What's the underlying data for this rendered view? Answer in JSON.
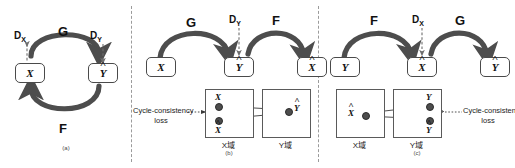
{
  "figure": {
    "colors": {
      "arrow": "#4d4d4d",
      "dashed_arrow": "#6e6e6e",
      "box_border": "#4a4a4a",
      "divider": "#9b9b9b",
      "point": "#4d4d4d",
      "background": "#ffffff"
    }
  },
  "panel_a": {
    "caption": "(a)",
    "nodes": [
      {
        "id": "x",
        "label": "X",
        "hat": false
      },
      {
        "id": "y_hat",
        "label": "Y",
        "hat": true
      }
    ],
    "mappings": [
      {
        "id": "g",
        "label": "G",
        "from": "x",
        "to": "y_hat"
      },
      {
        "id": "f",
        "label": "F",
        "from": "y_hat",
        "to": "x"
      }
    ],
    "discriminators": [
      {
        "id": "dx",
        "label": "D",
        "subscript": "X",
        "target": "x"
      },
      {
        "id": "dy",
        "label": "D",
        "subscript": "Y",
        "target": "y_hat"
      }
    ]
  },
  "panel_b": {
    "caption": "(b)",
    "nodes": [
      {
        "id": "x",
        "label": "X",
        "hat": false
      },
      {
        "id": "y_hat",
        "label": "Y",
        "hat": true
      },
      {
        "id": "x_hat",
        "label": "X",
        "hat": true
      }
    ],
    "mappings": [
      {
        "id": "g",
        "label": "G",
        "from": "x",
        "to": "y_hat"
      },
      {
        "id": "f",
        "label": "F",
        "from": "y_hat",
        "to": "x_hat"
      }
    ],
    "discriminators": [
      {
        "id": "dy",
        "label": "D",
        "subscript": "Y",
        "target": "y_hat"
      }
    ],
    "loss_label_line1": "Cycle-consistency",
    "loss_label_line2": "loss",
    "domains": [
      {
        "id": "x_domain",
        "label": "X域"
      },
      {
        "id": "y_domain",
        "label": "Y域"
      }
    ],
    "points": [
      {
        "id": "p_x",
        "label": "X",
        "hat": false,
        "domain": "x_domain"
      },
      {
        "id": "p_x_hat",
        "label": "X",
        "hat": true,
        "domain": "x_domain"
      },
      {
        "id": "p_y_hat",
        "label": "Y",
        "hat": true,
        "domain": "y_domain"
      }
    ]
  },
  "panel_c": {
    "caption": "(c)",
    "nodes": [
      {
        "id": "y",
        "label": "Y",
        "hat": false
      },
      {
        "id": "x_hat",
        "label": "X",
        "hat": true
      },
      {
        "id": "y_hat",
        "label": "Y",
        "hat": true
      }
    ],
    "mappings": [
      {
        "id": "f",
        "label": "F",
        "from": "y",
        "to": "x_hat"
      },
      {
        "id": "g",
        "label": "G",
        "from": "x_hat",
        "to": "y_hat"
      }
    ],
    "discriminators": [
      {
        "id": "dx",
        "label": "D",
        "subscript": "X",
        "target": "x_hat"
      }
    ],
    "loss_label_line1": "Cycle-consistency",
    "loss_label_line2": "loss",
    "domains": [
      {
        "id": "x_domain",
        "label": "X域"
      },
      {
        "id": "y_domain",
        "label": "Y域"
      }
    ],
    "points": [
      {
        "id": "p_x_hat",
        "label": "X",
        "hat": true,
        "domain": "x_domain"
      },
      {
        "id": "p_y",
        "label": "Y",
        "hat": false,
        "domain": "y_domain"
      },
      {
        "id": "p_y_hat",
        "label": "Y",
        "hat": true,
        "domain": "y_domain"
      }
    ]
  }
}
